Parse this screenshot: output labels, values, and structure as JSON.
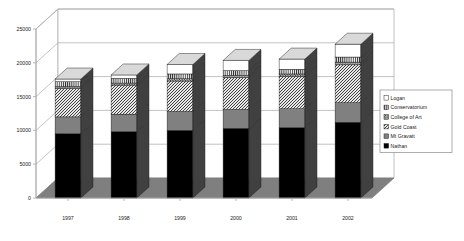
{
  "chart_data": {
    "type": "bar",
    "subtype": "stacked-column-3d",
    "title": "",
    "xlabel": "",
    "ylabel": "",
    "categories": [
      "1997",
      "1998",
      "1999",
      "2000",
      "2001",
      "2002"
    ],
    "ylim": [
      0,
      25000
    ],
    "yticks": [
      0,
      5000,
      10000,
      15000,
      20000,
      25000
    ],
    "ytick_labels": [
      "0",
      "5000",
      "10000",
      "15000",
      "20000",
      "25000"
    ],
    "grid": true,
    "legend_position": "right",
    "stack_order_bottom_to_top": [
      "Nathan",
      "Mt Gravatt",
      "Gold Coast",
      "College of Art",
      "Conservatorium",
      "Logan"
    ],
    "series": [
      {
        "name": "Nathan",
        "pattern": "solid-black",
        "color": "#000000",
        "values": [
          9500,
          9800,
          10000,
          10300,
          10400,
          11200
        ]
      },
      {
        "name": "Mt Gravatt",
        "pattern": "solid-gray",
        "color": "#808080",
        "values": [
          2500,
          2600,
          2800,
          2800,
          2800,
          2900
        ]
      },
      {
        "name": "Gold Coast",
        "pattern": "diagonal-hatch",
        "color": "#c8c8c8",
        "values": [
          4200,
          4300,
          4500,
          4700,
          4800,
          5600
        ]
      },
      {
        "name": "College of Art",
        "pattern": "dense-dots",
        "color": "#b0b0b0",
        "values": [
          300,
          300,
          350,
          350,
          350,
          400
        ]
      },
      {
        "name": "Conservatorium",
        "pattern": "vertical-stripes",
        "color": "#d0d0d0",
        "values": [
          700,
          700,
          700,
          700,
          700,
          750
        ]
      },
      {
        "name": "Logan",
        "pattern": "white",
        "color": "#ffffff",
        "values": [
          400,
          500,
          1400,
          1500,
          1500,
          1900
        ]
      }
    ],
    "totals": [
      17600,
      18200,
      19750,
      20350,
      20550,
      22750
    ]
  },
  "legend": {
    "items": [
      {
        "label": "Logan"
      },
      {
        "label": "Conservatorium"
      },
      {
        "label": "College of Art"
      },
      {
        "label": "Gold Coast"
      },
      {
        "label": "Mt Gravatt"
      },
      {
        "label": "Nathan"
      }
    ]
  },
  "colors": {
    "floor": "#7f7f7f",
    "wall": "#ffffff",
    "gridline": "#a8a8a8",
    "axis": "#a8a8a8",
    "bar_side": "#404040",
    "legend_border": "#8a8a8a"
  }
}
